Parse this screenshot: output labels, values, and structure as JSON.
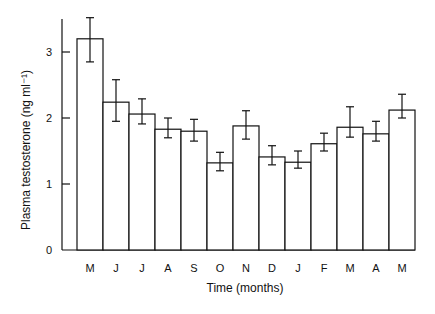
{
  "chart_data": {
    "type": "bar",
    "title": "",
    "xlabel": "Time (months)",
    "ylabel": "Plasma testosterone (ng ml⁻¹)",
    "ylim": [
      0,
      3.5
    ],
    "yticks": [
      0,
      1,
      2,
      3
    ],
    "grid": false,
    "legend": null,
    "categories": [
      "M",
      "J",
      "J",
      "A",
      "S",
      "O",
      "N",
      "D",
      "J",
      "F",
      "M",
      "A",
      "M"
    ],
    "values": [
      3.2,
      2.24,
      2.06,
      1.83,
      1.8,
      1.32,
      1.88,
      1.41,
      1.33,
      1.61,
      1.86,
      1.76,
      2.12
    ],
    "error_upper": [
      3.52,
      2.58,
      2.29,
      2.0,
      1.98,
      1.48,
      2.11,
      1.58,
      1.5,
      1.77,
      2.17,
      1.95,
      2.36
    ],
    "error_lower": [
      2.85,
      1.95,
      1.91,
      1.7,
      1.65,
      1.2,
      1.68,
      1.29,
      1.24,
      1.5,
      1.71,
      1.65,
      2.0
    ],
    "colors": {
      "bar_fill": "#ffffff",
      "bar_stroke": "#111111",
      "axis": "#111111"
    }
  }
}
